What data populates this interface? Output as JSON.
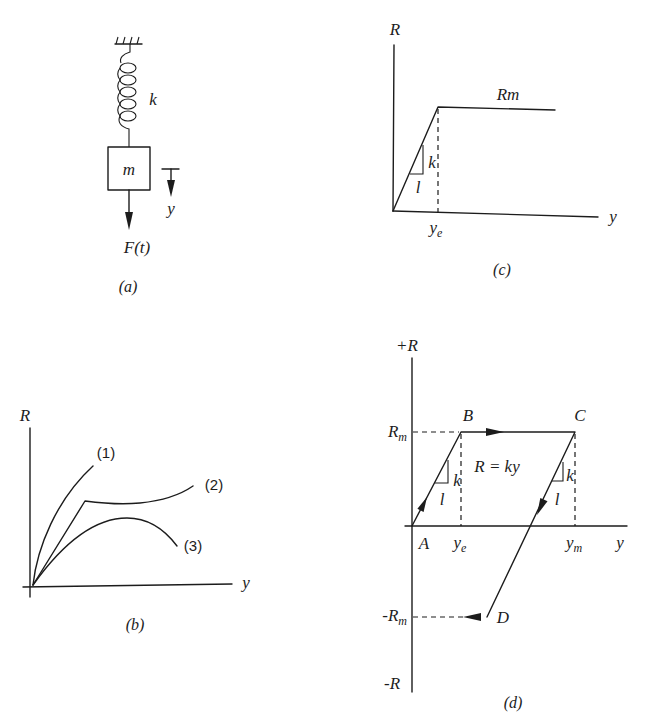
{
  "figure": {
    "panel_a": {
      "caption": "(a)",
      "spring_label": "k",
      "mass_label": "m",
      "displacement_label": "y",
      "force_label": "F(t)"
    },
    "panel_b": {
      "caption": "(b)",
      "y_axis_label": "R",
      "x_axis_label": "y",
      "curve_labels": [
        "(1)",
        "(2)",
        "(3)"
      ]
    },
    "panel_c": {
      "caption": "(c)",
      "y_axis_label": "R",
      "x_axis_label": "y",
      "plateau_label": "Rm",
      "yield_label": {
        "base": "y",
        "sub": "e"
      },
      "slope_rise": "k",
      "slope_run": "l"
    },
    "panel_d": {
      "caption": "(d)",
      "y_axis_top_label": "+R",
      "y_axis_bottom_label": "-R",
      "x_axis_label": "y",
      "pos_max_label": {
        "base": "R",
        "sub": "m"
      },
      "neg_max_label": {
        "base": "-R",
        "sub": "m"
      },
      "yield_label": {
        "base": "y",
        "sub": "e"
      },
      "max_disp_label": {
        "base": "y",
        "sub": "m"
      },
      "points": {
        "A": "A",
        "B": "B",
        "C": "C",
        "D": "D"
      },
      "equation": "R = ky",
      "slope_ab": {
        "rise": "k",
        "run": "l"
      },
      "slope_cd": {
        "rise": "k",
        "run": "l"
      }
    }
  }
}
